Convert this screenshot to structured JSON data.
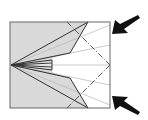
{
  "diagram": {
    "type": "origami-fold-instruction",
    "colors": {
      "background": "#ffffff",
      "paper_shaded": "#d9d9d9",
      "outline": "#555555",
      "edge_dark": "#222222",
      "crease_light": "#b0b0b0",
      "fold_line": "#444444",
      "arrow": "#111111"
    },
    "frame": {
      "x": 10,
      "y": 22,
      "width": 100,
      "height": 86
    },
    "point": {
      "x": 11,
      "y": 65
    },
    "arrows": [
      {
        "name": "top-arrow",
        "direction": "down-left"
      },
      {
        "name": "bottom-arrow",
        "direction": "up-left"
      }
    ]
  }
}
